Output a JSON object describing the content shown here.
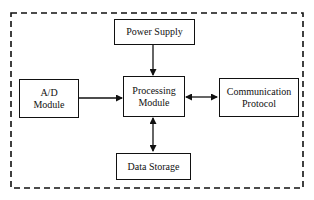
{
  "diagram": {
    "type": "block-diagram",
    "boundary": "dashed",
    "nodes": [
      {
        "id": "power_supply",
        "label": "Power Supply"
      },
      {
        "id": "ad_module",
        "label_line1": "A/D",
        "label_line2": "Module"
      },
      {
        "id": "processing_module",
        "label_line1": "Processing",
        "label_line2": "Module"
      },
      {
        "id": "communication_protocol",
        "label_line1": "Communication",
        "label_line2": "Protocol"
      },
      {
        "id": "data_storage",
        "label": "Data Storage"
      }
    ],
    "edges": [
      {
        "from": "power_supply",
        "to": "processing_module",
        "direction": "one-way"
      },
      {
        "from": "ad_module",
        "to": "processing_module",
        "direction": "one-way"
      },
      {
        "from": "processing_module",
        "to": "communication_protocol",
        "direction": "two-way"
      },
      {
        "from": "processing_module",
        "to": "data_storage",
        "direction": "two-way"
      }
    ],
    "colors": {
      "stroke": "#111111",
      "background": "#ffffff"
    }
  }
}
